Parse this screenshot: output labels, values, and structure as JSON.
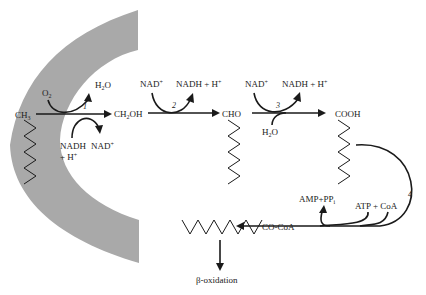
{
  "colors": {
    "membrane": "#a9a9a9",
    "ink": "#1a1a1a",
    "background": "#ffffff"
  },
  "substrates": {
    "methyl": "CH3",
    "alcohol": "CH2OH",
    "aldehyde": "CHO",
    "acid": "COOH",
    "acyl_coa": "CO-CoA"
  },
  "steps": [
    {
      "number": "1",
      "inputs": [
        "O2",
        "NADH + H+"
      ],
      "outputs": [
        "H2O",
        "NAD+"
      ]
    },
    {
      "number": "2",
      "inputs": [
        "NAD+"
      ],
      "outputs": [
        "NADH + H+"
      ]
    },
    {
      "number": "3",
      "inputs": [
        "NAD+",
        "H2O"
      ],
      "outputs": [
        "NADH + H+"
      ]
    },
    {
      "number": "4",
      "inputs": [
        "ATP + CoA"
      ],
      "outputs": [
        "AMP+PPi"
      ]
    }
  ],
  "labels": {
    "s1_o2_main": "O",
    "s1_o2_sub": "2",
    "s1_h2o_a": "H",
    "s1_h2o_sub": "2",
    "s1_h2o_b": "O",
    "s1_nadh": "NADH",
    "s1_h": "+ H",
    "s1_h_sup": "+",
    "s1_nad": "NAD",
    "s1_nad_sup": "+",
    "ch3_main": "CH",
    "ch3_sub": "3",
    "ch2oh_a": "CH",
    "ch2oh_sub": "2",
    "ch2oh_b": "OH",
    "s2_nad": "NAD",
    "s2_nad_sup": "+",
    "s2_nadh": "NADH + H",
    "s2_nadh_sup": "+",
    "cho": "CHO",
    "s3_nad": "NAD",
    "s3_nad_sup": "+",
    "s3_nadh": "NADH + H",
    "s3_nadh_sup": "+",
    "s3_h2o_a": "H",
    "s3_h2o_sub": "2",
    "s3_h2o_b": "O",
    "cooh": "COOH",
    "s4_amp": "AMP+PP",
    "s4_amp_sub": "i",
    "s4_atp": "ATP + CoA",
    "coa": "CO-CoA",
    "beta": "β-oxidation",
    "n1": "1",
    "n2": "2",
    "n3": "3",
    "n4": "4"
  }
}
